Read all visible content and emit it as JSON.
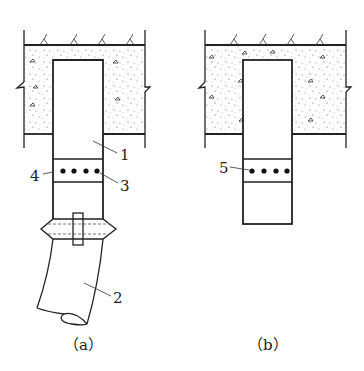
{
  "figure": {
    "panels": [
      {
        "id": "a",
        "caption": "（a）",
        "labels": [
          {
            "text": "1",
            "x": 123,
            "y": 159
          },
          {
            "text": "4",
            "x": 29,
            "y": 180
          },
          {
            "text": "3",
            "x": 121,
            "y": 191
          },
          {
            "text": "2",
            "x": 115,
            "y": 303
          }
        ],
        "components": [
          "concrete-slab",
          "pile-column",
          "bolt-band",
          "coupling-collar",
          "curved-pipe"
        ]
      },
      {
        "id": "b",
        "caption": "（b）",
        "labels": [
          {
            "text": "5",
            "x": 219,
            "y": 172
          }
        ],
        "components": [
          "concrete-slab",
          "pile-column",
          "bolt-band"
        ]
      }
    ],
    "colors": {
      "line": "#222222",
      "background": "#ffffff",
      "stipple": "#555555"
    }
  }
}
